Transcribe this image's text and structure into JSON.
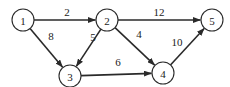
{
  "diagram": {
    "type": "directed-weighted-graph",
    "node_radius": 11,
    "nodes": [
      {
        "id": "1",
        "label": "1",
        "x": 23,
        "y": 20
      },
      {
        "id": "2",
        "label": "2",
        "x": 107,
        "y": 20
      },
      {
        "id": "3",
        "label": "3",
        "x": 70,
        "y": 76
      },
      {
        "id": "4",
        "label": "4",
        "x": 163,
        "y": 73
      },
      {
        "id": "5",
        "label": "5",
        "x": 212,
        "y": 20
      }
    ],
    "edges": [
      {
        "from": "1",
        "to": "2",
        "weight": "2",
        "lx": 67,
        "ly": 12
      },
      {
        "from": "1",
        "to": "3",
        "weight": "8",
        "lx": 51,
        "ly": 36
      },
      {
        "from": "2",
        "to": "3",
        "weight": "5",
        "lx": 93,
        "ly": 37
      },
      {
        "from": "2",
        "to": "4",
        "weight": "4",
        "lx": 139,
        "ly": 34
      },
      {
        "from": "2",
        "to": "5",
        "weight": "12",
        "lx": 159,
        "ly": 12
      },
      {
        "from": "3",
        "to": "4",
        "weight": "6",
        "lx": 118,
        "ly": 62
      },
      {
        "from": "4",
        "to": "5",
        "weight": "10",
        "lx": 177,
        "ly": 42
      }
    ]
  }
}
